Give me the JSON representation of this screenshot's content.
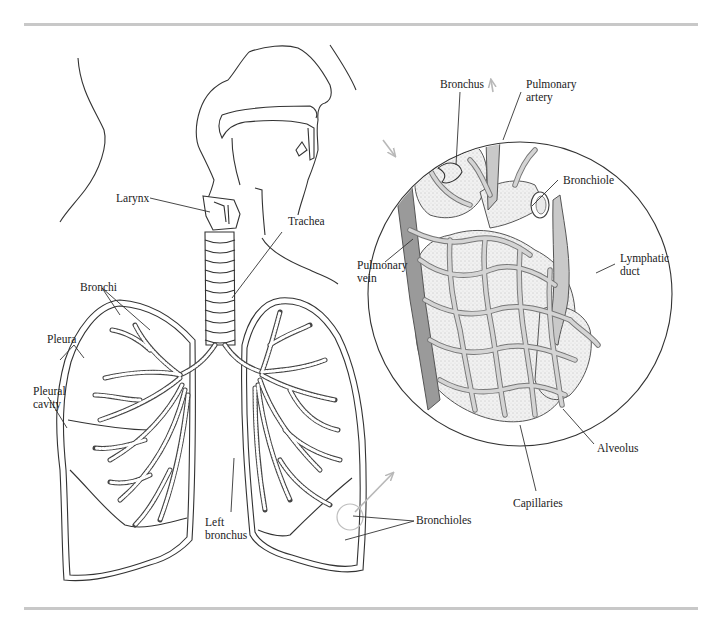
{
  "figure": {
    "rule_color": "#c8c8c8",
    "line_color": "#333333",
    "vessel_fill": "#c9c9c9",
    "vein_fill": "#9a9a9a",
    "arrow_color": "#b8b8b8"
  },
  "labels": {
    "larynx": "Larynx",
    "trachea": "Trachea",
    "bronchi": "Bronchi",
    "pleura": "Pleura",
    "pleural_cavity": "Pleural cavity",
    "left_bronchus": "Left bronchus",
    "bronchioles": "Bronchioles",
    "bronchus": "Bronchus",
    "pulmonary_artery": "Pulmonary artery",
    "bronchiole": "Bronchiole",
    "pulmonary_vein": "Pulmonary vein",
    "lymphatic_duct": "Lymphatic duct",
    "alveolus": "Alveolus",
    "capillaries": "Capillaries"
  }
}
